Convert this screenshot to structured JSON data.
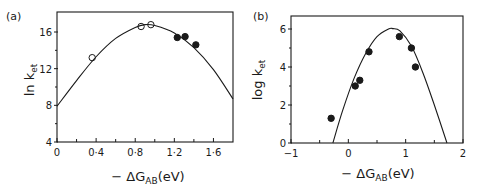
{
  "chart_data": [
    {
      "type": "scatter",
      "panel_label": "(a)",
      "title": "",
      "xlabel": "− ΔG_AB (eV)",
      "xlabel_main": "− ΔG",
      "xlabel_sub": "AB",
      "xlabel_unit": "(eV)",
      "ylabel": "ln k_et",
      "ylabel_main": "ln k",
      "ylabel_sub": "et",
      "xlim": [
        0,
        1.8
      ],
      "ylim": [
        4,
        18
      ],
      "xticks": [
        0,
        0.4,
        0.8,
        1.2,
        1.6
      ],
      "xtick_labels": [
        "0",
        "0·4",
        "0·8",
        "1·2",
        "1·6"
      ],
      "xminor": [
        0.2,
        0.6,
        1.0,
        1.4
      ],
      "yticks": [
        4,
        8,
        12,
        16
      ],
      "ytick_labels": [
        "4",
        "8",
        "12",
        "16"
      ],
      "yminor": [
        6,
        10,
        14
      ],
      "grid": false,
      "series": [
        {
          "name": "open circles",
          "marker": "open-circle",
          "x": [
            0.36,
            0.86,
            0.96
          ],
          "y": [
            13.2,
            16.6,
            16.8
          ]
        },
        {
          "name": "filled circles",
          "marker": "filled-circle",
          "x": [
            1.23,
            1.31,
            1.42
          ],
          "y": [
            15.4,
            15.5,
            14.6
          ]
        },
        {
          "name": "theoretical curve (parabola)",
          "marker": "line",
          "x": [
            0,
            0.2,
            0.4,
            0.6,
            0.8,
            0.9,
            1.0,
            1.2,
            1.4,
            1.6,
            1.8
          ],
          "y": [
            7.9,
            10.7,
            13.3,
            15.3,
            16.5,
            16.8,
            16.7,
            15.9,
            14.3,
            11.9,
            8.7
          ]
        }
      ]
    },
    {
      "type": "scatter",
      "panel_label": "(b)",
      "title": "",
      "xlabel": "− ΔG_AB (eV)",
      "xlabel_main": "− ΔG",
      "xlabel_sub": "AB",
      "xlabel_unit": "(eV)",
      "ylabel": "log k_et",
      "ylabel_main": "log k",
      "ylabel_sub": "et",
      "xlim": [
        -1,
        2
      ],
      "ylim": [
        0,
        6.7
      ],
      "xticks": [
        -1,
        0,
        1,
        2
      ],
      "xtick_labels": [
        "−1",
        "0",
        "1",
        "2"
      ],
      "xminor": [
        -0.5,
        0.5,
        1.5
      ],
      "yticks": [
        0,
        2,
        4,
        6
      ],
      "ytick_labels": [
        "0",
        "2",
        "4",
        "6"
      ],
      "yminor": [
        1,
        3,
        5
      ],
      "grid": false,
      "series": [
        {
          "name": "filled circles",
          "marker": "filled-circle",
          "x": [
            -0.3,
            0.12,
            0.2,
            0.36,
            0.89,
            1.1,
            1.17
          ],
          "y": [
            1.3,
            3.0,
            3.3,
            4.8,
            5.6,
            5.0,
            4.0
          ]
        },
        {
          "name": "theoretical curve",
          "marker": "line",
          "x": [
            -0.27,
            -0.1,
            0.1,
            0.3,
            0.5,
            0.7,
            0.78,
            0.9,
            1.1,
            1.3,
            1.5,
            1.72
          ],
          "y": [
            0,
            1.7,
            3.4,
            4.7,
            5.6,
            6.0,
            6.02,
            5.9,
            5.1,
            3.7,
            2.0,
            0
          ]
        }
      ]
    }
  ]
}
